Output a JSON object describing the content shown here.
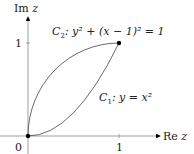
{
  "axes": {
    "y_label_re": "Im",
    "y_label_var": "z",
    "x_label_re": "Re",
    "x_label_var": "z",
    "origin_label": "0",
    "x_tick_label": "1",
    "y_tick_label": "1"
  },
  "curves": {
    "c2": {
      "name": "C",
      "sub": "2",
      "equation": ": y² + (x − 1)² = 1"
    },
    "c1": {
      "name": "C",
      "sub": "1",
      "equation": ": y = x²"
    }
  },
  "colors": {
    "line": "#444444",
    "point": "#000000"
  }
}
